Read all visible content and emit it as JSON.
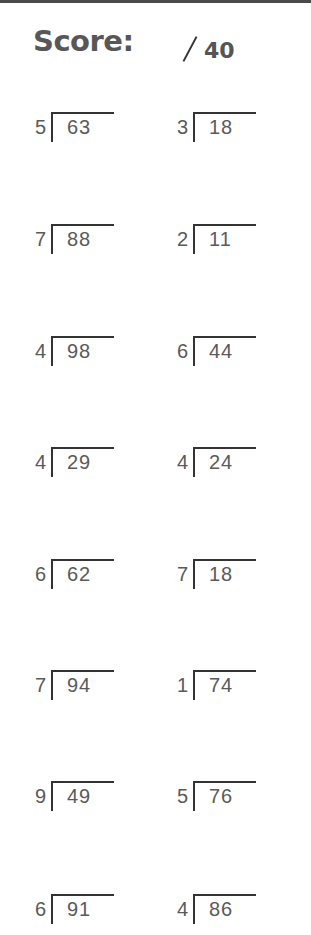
{
  "header": {
    "score_label": "Score:",
    "score_slash": "/",
    "score_total": "40"
  },
  "problems": [
    {
      "divisor": "5",
      "dividend": "63"
    },
    {
      "divisor": "3",
      "dividend": "18"
    },
    {
      "divisor": "7",
      "dividend": "88"
    },
    {
      "divisor": "2",
      "dividend": "11"
    },
    {
      "divisor": "4",
      "dividend": "98"
    },
    {
      "divisor": "6",
      "dividend": "44"
    },
    {
      "divisor": "4",
      "dividend": "29"
    },
    {
      "divisor": "4",
      "dividend": "24"
    },
    {
      "divisor": "6",
      "dividend": "62"
    },
    {
      "divisor": "7",
      "dividend": "18"
    },
    {
      "divisor": "7",
      "dividend": "94"
    },
    {
      "divisor": "1",
      "dividend": "74"
    },
    {
      "divisor": "9",
      "dividend": "49"
    },
    {
      "divisor": "5",
      "dividend": "76"
    },
    {
      "divisor": "6",
      "dividend": "91"
    },
    {
      "divisor": "4",
      "dividend": "86"
    }
  ],
  "colors": {
    "text": "#5a5a5a",
    "rule": "#333333"
  }
}
